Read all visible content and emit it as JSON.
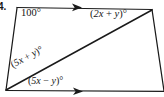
{
  "figure": {
    "problem_number": "4.",
    "background_color": "#ffffff",
    "stroke_color": "#1a1a1a",
    "type": "geometry-diagram",
    "shape": "quadrilateral-with-diagonal",
    "labels": {
      "angle_top_left": "100°",
      "angle_top_right_open": "(",
      "angle_top_right_a": "2x",
      "angle_top_right_plus": " + ",
      "angle_top_right_b": "y",
      "angle_top_right_close": ")°",
      "angle_top_right_full": "(2x + y)°",
      "angle_lower_left_upper_full": "(5x + y)°",
      "angle_lower_left_lower_full": "(5x − y)°"
    },
    "label_parts": {
      "top_right": {
        "open": "(",
        "coef": "2x",
        "op": " + ",
        "var": "y",
        "close": ")°"
      },
      "diagonal_upper": {
        "open": "(",
        "coef": "5x",
        "op": " + ",
        "var": "y",
        "close": ")°"
      },
      "diagonal_lower": {
        "open": "(",
        "coef": "5x",
        "op": " − ",
        "var": "y",
        "close": ")°"
      }
    },
    "geometry": {
      "vertices": {
        "top_left": [
          17,
          8
        ],
        "top_right": [
          152,
          10
        ],
        "bottom_right": [
          164,
          91
        ],
        "bottom_left": [
          6,
          90
        ]
      },
      "diagonal": [
        [
          6,
          90
        ],
        [
          152,
          10
        ]
      ],
      "top_side_arrow_at": [
        79,
        7
      ],
      "bottom_side_arrow_at": [
        80,
        91
      ],
      "arrow_direction": "right"
    }
  }
}
